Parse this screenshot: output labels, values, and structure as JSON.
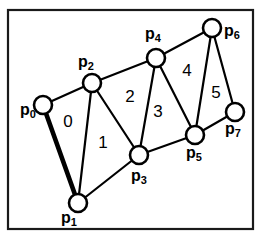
{
  "figure": {
    "background_color": "#ffffff",
    "line_color": "#000000",
    "frame": {
      "x": 8,
      "y": 10,
      "width": 245,
      "height": 219
    }
  },
  "chart_data": {
    "type": "diagram",
    "title": "",
    "vertices": [
      {
        "id": "p0",
        "label_main": "p",
        "label_sub": "0",
        "x": 43,
        "y": 105,
        "r": 9,
        "label_x": 20,
        "label_y": 111
      },
      {
        "id": "p1",
        "label_main": "p",
        "label_sub": "1",
        "x": 78,
        "y": 203,
        "r": 9,
        "label_x": 61,
        "label_y": 219
      },
      {
        "id": "p2",
        "label_main": "p",
        "label_sub": "2",
        "x": 92,
        "y": 83,
        "r": 9,
        "label_x": 78,
        "label_y": 63
      },
      {
        "id": "p3",
        "label_main": "p",
        "label_sub": "3",
        "x": 139,
        "y": 155,
        "r": 9,
        "label_x": 131,
        "label_y": 177
      },
      {
        "id": "p4",
        "label_main": "p",
        "label_sub": "4",
        "x": 156,
        "y": 58,
        "r": 9,
        "label_x": 145,
        "label_y": 35
      },
      {
        "id": "p5",
        "label_main": "p",
        "label_sub": "5",
        "x": 195,
        "y": 135,
        "r": 9,
        "label_x": 186,
        "label_y": 154
      },
      {
        "id": "p6",
        "label_main": "p",
        "label_sub": "6",
        "x": 212,
        "y": 28,
        "r": 9,
        "label_x": 224,
        "label_y": 32
      },
      {
        "id": "p7",
        "label_main": "p",
        "label_sub": "7",
        "x": 235,
        "y": 112,
        "r": 9,
        "label_x": 225,
        "label_y": 130
      }
    ],
    "edges": [
      {
        "from": "p0",
        "to": "p2",
        "weight": "normal"
      },
      {
        "from": "p0",
        "to": "p1",
        "weight": "thick"
      },
      {
        "from": "p1",
        "to": "p2",
        "weight": "normal"
      },
      {
        "from": "p1",
        "to": "p3",
        "weight": "normal"
      },
      {
        "from": "p2",
        "to": "p3",
        "weight": "normal"
      },
      {
        "from": "p2",
        "to": "p4",
        "weight": "normal"
      },
      {
        "from": "p3",
        "to": "p4",
        "weight": "normal"
      },
      {
        "from": "p3",
        "to": "p5",
        "weight": "normal"
      },
      {
        "from": "p4",
        "to": "p5",
        "weight": "normal"
      },
      {
        "from": "p4",
        "to": "p6",
        "weight": "normal"
      },
      {
        "from": "p5",
        "to": "p6",
        "weight": "normal"
      },
      {
        "from": "p5",
        "to": "p7",
        "weight": "normal"
      },
      {
        "from": "p6",
        "to": "p7",
        "weight": "normal"
      }
    ],
    "faces": [
      {
        "label": "0",
        "x": 68,
        "y": 123,
        "vertices": [
          "p0",
          "p1",
          "p2"
        ]
      },
      {
        "label": "1",
        "x": 103,
        "y": 144,
        "vertices": [
          "p1",
          "p3",
          "p2"
        ]
      },
      {
        "label": "2",
        "x": 130,
        "y": 98,
        "vertices": [
          "p2",
          "p3",
          "p4"
        ]
      },
      {
        "label": "3",
        "x": 158,
        "y": 113,
        "vertices": [
          "p3",
          "p5",
          "p4"
        ]
      },
      {
        "label": "4",
        "x": 187,
        "y": 72,
        "vertices": [
          "p4",
          "p5",
          "p6"
        ]
      },
      {
        "label": "5",
        "x": 216,
        "y": 94,
        "vertices": [
          "p5",
          "p7",
          "p6"
        ]
      }
    ]
  }
}
